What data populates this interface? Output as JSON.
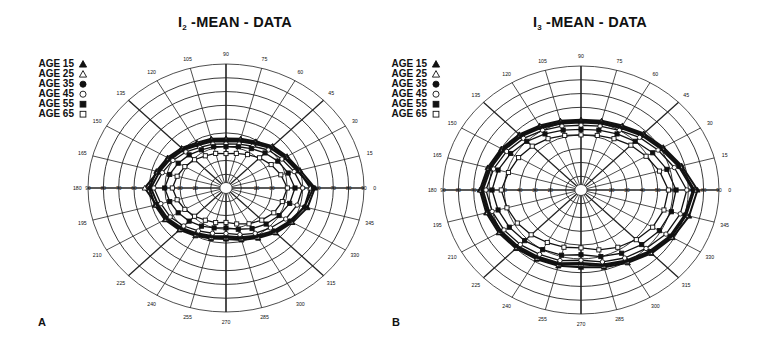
{
  "chart_data": [
    {
      "type": "polar-line",
      "panel_letter": "A",
      "title": "I2 -MEAN - DATA",
      "title_main": "I",
      "title_sub": "2",
      "title_rest": " -MEAN - DATA",
      "angle_labels": [
        0,
        15,
        30,
        45,
        60,
        75,
        90,
        105,
        120,
        135,
        150,
        165,
        180,
        195,
        210,
        225,
        240,
        255,
        270,
        285,
        300,
        315,
        330,
        345
      ],
      "radial_ticks": [
        10,
        20,
        30,
        40,
        50,
        60,
        70,
        80,
        90
      ],
      "rlim": [
        0,
        90
      ],
      "grid": true,
      "legend_position": "upper-left",
      "angles": [
        0,
        15,
        30,
        45,
        60,
        75,
        90,
        105,
        120,
        135,
        150,
        165,
        180,
        195,
        210,
        225,
        240,
        255,
        270,
        285,
        300,
        315,
        330,
        345
      ],
      "series": [
        {
          "name": "AGE 15",
          "marker": "filled-triangle",
          "values": [
            58,
            50,
            46,
            43,
            39,
            37,
            36,
            37,
            38,
            41,
            44,
            47,
            50,
            48,
            46,
            43,
            40,
            38,
            37,
            39,
            42,
            46,
            50,
            55
          ]
        },
        {
          "name": "AGE 25",
          "marker": "open-triangle",
          "values": [
            55,
            49,
            45,
            42,
            38,
            36,
            35,
            36,
            37,
            40,
            43,
            46,
            53,
            47,
            45,
            42,
            39,
            37,
            36,
            38,
            41,
            45,
            49,
            53
          ]
        },
        {
          "name": "AGE 35",
          "marker": "filled-circle",
          "values": [
            57,
            48,
            44,
            41,
            37,
            35,
            34,
            35,
            36,
            39,
            42,
            45,
            49,
            46,
            44,
            41,
            38,
            36,
            35,
            37,
            40,
            44,
            48,
            53
          ]
        },
        {
          "name": "AGE 45",
          "marker": "open-circle",
          "values": [
            50,
            46,
            42,
            39,
            35,
            33,
            32,
            33,
            34,
            37,
            40,
            43,
            47,
            44,
            42,
            39,
            36,
            34,
            33,
            35,
            38,
            41,
            45,
            48
          ]
        },
        {
          "name": "AGE 55",
          "marker": "filled-square",
          "values": [
            45,
            42,
            39,
            36,
            33,
            31,
            30,
            31,
            32,
            34,
            36,
            38,
            40,
            38,
            36,
            34,
            32,
            30,
            29,
            31,
            34,
            37,
            40,
            43
          ]
        },
        {
          "name": "AGE 65",
          "marker": "open-square",
          "values": [
            40,
            37,
            34,
            31,
            28,
            26,
            25,
            26,
            27,
            29,
            31,
            33,
            35,
            33,
            31,
            29,
            27,
            26,
            25,
            27,
            30,
            33,
            36,
            38
          ]
        }
      ]
    },
    {
      "type": "polar-line",
      "panel_letter": "B",
      "title": "I3 -MEAN - DATA",
      "title_main": "I",
      "title_sub": "3",
      "title_rest": " -MEAN - DATA",
      "angle_labels": [
        0,
        15,
        30,
        45,
        60,
        75,
        90,
        105,
        120,
        135,
        150,
        165,
        180,
        195,
        210,
        225,
        240,
        255,
        270,
        285,
        300,
        315,
        330,
        345
      ],
      "radial_ticks": [
        10,
        20,
        30,
        40,
        50,
        60,
        70,
        80,
        90
      ],
      "rlim": [
        0,
        90
      ],
      "grid": true,
      "legend_position": "upper-left",
      "angles": [
        0,
        15,
        30,
        45,
        60,
        75,
        90,
        105,
        120,
        135,
        150,
        165,
        180,
        195,
        210,
        225,
        240,
        255,
        270,
        285,
        300,
        315,
        330,
        345
      ],
      "series": [
        {
          "name": "AGE 15",
          "marker": "filled-triangle",
          "values": [
            76,
            68,
            62,
            58,
            54,
            52,
            51,
            52,
            54,
            57,
            60,
            63,
            66,
            64,
            62,
            60,
            58,
            57,
            56,
            58,
            61,
            65,
            69,
            73
          ]
        },
        {
          "name": "AGE 25",
          "marker": "open-triangle",
          "values": [
            74,
            67,
            61,
            57,
            53,
            51,
            50,
            51,
            53,
            56,
            59,
            62,
            65,
            63,
            61,
            59,
            57,
            56,
            54,
            57,
            60,
            64,
            68,
            71
          ]
        },
        {
          "name": "AGE 35",
          "marker": "filled-circle",
          "values": [
            73,
            66,
            60,
            56,
            52,
            50,
            49,
            50,
            52,
            55,
            58,
            61,
            64,
            62,
            60,
            58,
            56,
            55,
            53,
            56,
            59,
            63,
            67,
            70
          ]
        },
        {
          "name": "AGE 45",
          "marker": "open-circle",
          "values": [
            69,
            63,
            58,
            54,
            50,
            48,
            47,
            48,
            50,
            53,
            56,
            59,
            62,
            60,
            58,
            56,
            54,
            53,
            51,
            54,
            57,
            60,
            64,
            67
          ]
        },
        {
          "name": "AGE 55",
          "marker": "filled-square",
          "values": [
            62,
            58,
            54,
            50,
            47,
            45,
            44,
            45,
            47,
            50,
            53,
            56,
            58,
            56,
            54,
            52,
            50,
            49,
            47,
            50,
            53,
            56,
            59,
            61
          ]
        },
        {
          "name": "AGE 65",
          "marker": "open-square",
          "values": [
            57,
            53,
            49,
            46,
            43,
            41,
            40,
            41,
            43,
            45,
            47,
            49,
            52,
            50,
            48,
            46,
            44,
            43,
            42,
            45,
            48,
            51,
            54,
            56
          ]
        }
      ]
    }
  ],
  "panels": [
    {
      "letter": "A",
      "title_main": "I",
      "title_sub": "2",
      "title_rest": " -MEAN - DATA",
      "legend": [
        {
          "label": "AGE 15",
          "marker": "filled-triangle"
        },
        {
          "label": "AGE 25",
          "marker": "open-triangle"
        },
        {
          "label": "AGE 35",
          "marker": "filled-circle"
        },
        {
          "label": "AGE 45",
          "marker": "open-circle"
        },
        {
          "label": "AGE 55",
          "marker": "filled-square"
        },
        {
          "label": "AGE 65",
          "marker": "open-square"
        }
      ]
    },
    {
      "letter": "B",
      "title_main": "I",
      "title_sub": "3",
      "title_rest": " -MEAN - DATA",
      "legend": [
        {
          "label": "AGE 15",
          "marker": "filled-triangle"
        },
        {
          "label": "AGE 25",
          "marker": "open-triangle"
        },
        {
          "label": "AGE 35",
          "marker": "filled-circle"
        },
        {
          "label": "AGE 45",
          "marker": "open-circle"
        },
        {
          "label": "AGE 55",
          "marker": "filled-square"
        },
        {
          "label": "AGE 65",
          "marker": "open-square"
        }
      ]
    }
  ],
  "colors": {
    "ink": "#111111",
    "grid": "#222222",
    "background": "#ffffff"
  }
}
